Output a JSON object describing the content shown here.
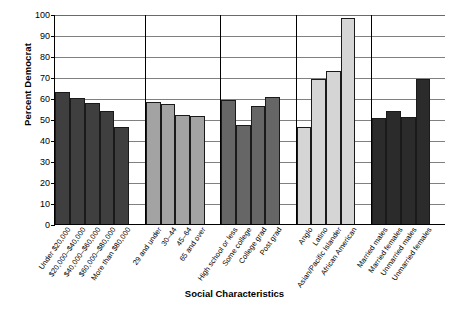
{
  "chart_data": {
    "type": "bar",
    "title": "",
    "xlabel": "Social Characteristics",
    "ylabel": "Percent Democrat",
    "ylim": [
      0,
      100
    ],
    "ytick_step": 10,
    "yticks": [
      0,
      10,
      20,
      30,
      40,
      50,
      60,
      70,
      80,
      90,
      100
    ],
    "grid": true,
    "grid_axis": "y",
    "legend": "none",
    "categories": [
      "Under $20,000",
      "$20,000–$40,000",
      "$40,000–$60,000",
      "$60,000–$80,000",
      "More than $80,000",
      "29 and under",
      "30–44",
      "45–64",
      "65 and over",
      "High school or less",
      "Some college",
      "College grad",
      "Post grad",
      "Anglo",
      "Latino",
      "Asian/Pacific Islander",
      "African American",
      "Married males",
      "Married females",
      "Unmarried males",
      "Unmarried females"
    ],
    "values": [
      63.0,
      60.5,
      58.0,
      54.0,
      46.5,
      58.5,
      57.5,
      52.0,
      51.5,
      59.5,
      47.5,
      56.5,
      61.0,
      46.5,
      69.5,
      73.0,
      98.5,
      50.5,
      54.0,
      51.0,
      69.5
    ],
    "groups": [
      {
        "name": "Income",
        "color": "#3f3f3f",
        "bars": [
          {
            "label": "Under $20,000",
            "value": 63.0
          },
          {
            "label": "$20,000–$40,000",
            "value": 60.5
          },
          {
            "label": "$40,000–$60,000",
            "value": 58.0
          },
          {
            "label": "$60,000–$80,000",
            "value": 54.0
          },
          {
            "label": "More than $80,000",
            "value": 46.5
          }
        ]
      },
      {
        "name": "Age",
        "color": "#a3a3a3",
        "bars": [
          {
            "label": "29 and under",
            "value": 58.5
          },
          {
            "label": "30–44",
            "value": 57.5
          },
          {
            "label": "45–64",
            "value": 52.0
          },
          {
            "label": "65 and over",
            "value": 51.5
          }
        ]
      },
      {
        "name": "Education",
        "color": "#666666",
        "bars": [
          {
            "label": "High school or less",
            "value": 59.5
          },
          {
            "label": "Some college",
            "value": 47.5
          },
          {
            "label": "College grad",
            "value": 56.5
          },
          {
            "label": "Post grad",
            "value": 61.0
          }
        ]
      },
      {
        "name": "Race/Ethnicity",
        "color": "#d5d5d5",
        "bars": [
          {
            "label": "Anglo",
            "value": 46.5
          },
          {
            "label": "Latino",
            "value": 69.5
          },
          {
            "label": "Asian/Pacific Islander",
            "value": 73.0
          },
          {
            "label": "African American",
            "value": 98.5
          }
        ]
      },
      {
        "name": "Marital status",
        "color": "#2b2b2b",
        "bars": [
          {
            "label": "Married males",
            "value": 50.5
          },
          {
            "label": "Married females",
            "value": 54.0
          },
          {
            "label": "Unmarried males",
            "value": 51.0
          },
          {
            "label": "Unmarried females",
            "value": 69.5
          }
        ]
      }
    ]
  },
  "axis": {
    "y_title": "Percent Democrat",
    "x_title": "Social Characteristics"
  }
}
